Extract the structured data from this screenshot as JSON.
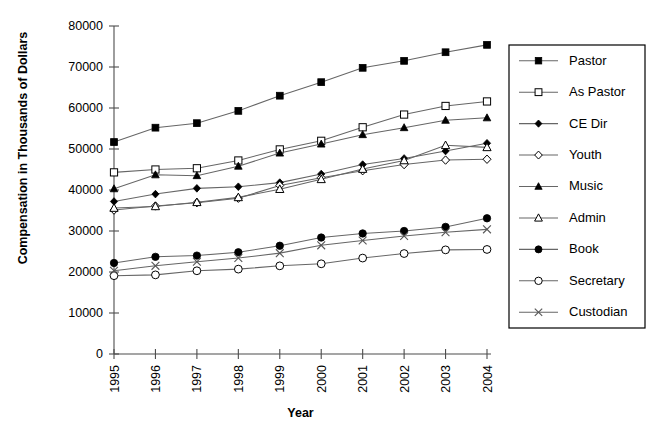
{
  "chart_data": {
    "type": "line",
    "title": "",
    "xlabel": "Year",
    "ylabel": "Compensation in Thousands of Dollars",
    "categories": [
      "1995",
      "1996",
      "1997",
      "1998",
      "1999",
      "2000",
      "2001",
      "2002",
      "2003",
      "2004"
    ],
    "x": [
      1995,
      1996,
      1997,
      1998,
      1999,
      2000,
      2001,
      2002,
      2003,
      2004
    ],
    "ylim": [
      0,
      80000
    ],
    "yticks": [
      0,
      10000,
      20000,
      30000,
      40000,
      50000,
      60000,
      70000,
      80000
    ],
    "ytick_labels": [
      "0",
      "10000",
      "20000",
      "30000",
      "40000",
      "50000",
      "60000",
      "70000",
      "80000"
    ],
    "grid": false,
    "legend_position": "right",
    "series": [
      {
        "name": "Pastor",
        "marker": "filled-square",
        "values": [
          51700,
          55200,
          56300,
          59300,
          63000,
          66300,
          69800,
          71500,
          73600,
          75400
        ]
      },
      {
        "name": "As Pastor",
        "marker": "open-square",
        "values": [
          44300,
          45000,
          45300,
          47200,
          49900,
          52000,
          55300,
          58400,
          60500,
          61600
        ]
      },
      {
        "name": "CE Dir",
        "marker": "filled-diamond",
        "values": [
          37200,
          39000,
          40400,
          40800,
          41800,
          43900,
          46200,
          47700,
          49500,
          51400
        ]
      },
      {
        "name": "Youth",
        "marker": "open-diamond",
        "values": [
          35100,
          36100,
          36900,
          38000,
          41100,
          43000,
          44700,
          46200,
          47300,
          47500
        ]
      },
      {
        "name": "Music",
        "marker": "filled-triangle",
        "values": [
          40300,
          43700,
          43500,
          45800,
          49000,
          51200,
          53500,
          55200,
          57000,
          57600
        ]
      },
      {
        "name": "Admin",
        "marker": "open-triangle",
        "values": [
          35600,
          36000,
          37000,
          38200,
          40200,
          42600,
          45100,
          47200,
          50900,
          50400
        ]
      },
      {
        "name": "Book",
        "marker": "filled-circle",
        "values": [
          22200,
          23700,
          24000,
          24800,
          26400,
          28400,
          29400,
          30000,
          31000,
          33100
        ]
      },
      {
        "name": "Secretary",
        "marker": "open-circle",
        "values": [
          19100,
          19300,
          20300,
          20700,
          21500,
          22000,
          23400,
          24500,
          25400,
          25500
        ]
      },
      {
        "name": "Custodian",
        "marker": "x-mark",
        "values": [
          20300,
          21500,
          22500,
          23400,
          24600,
          26500,
          27700,
          28800,
          29700,
          30400
        ]
      }
    ]
  },
  "axes": {
    "x_title": "Year",
    "y_title": "Compensation in Thousands of Dollars"
  },
  "legend": {
    "entries": [
      {
        "label": "Pastor"
      },
      {
        "label": "As Pastor"
      },
      {
        "label": "CE Dir"
      },
      {
        "label": "Youth"
      },
      {
        "label": "Music"
      },
      {
        "label": "Admin"
      },
      {
        "label": "Book"
      },
      {
        "label": "Secretary"
      },
      {
        "label": "Custodian"
      }
    ]
  },
  "colors": {
    "line": "#666666",
    "marker": "#000000",
    "axis": "#4d4d4d",
    "background": "#ffffff"
  }
}
